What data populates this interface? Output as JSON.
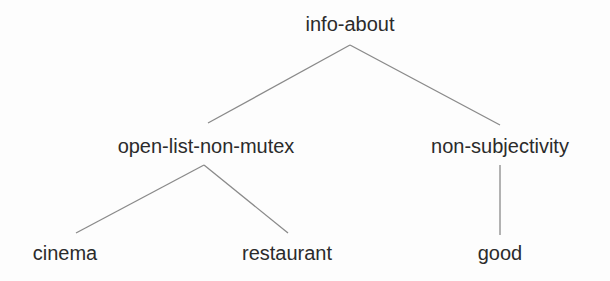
{
  "diagram": {
    "type": "tree",
    "colors": {
      "background": "#fdfdfd",
      "text": "#2b2b2b",
      "edge": "#8a8a8a"
    },
    "nodes": [
      {
        "id": "info-about",
        "label": "info-about",
        "x": 350,
        "y": 14
      },
      {
        "id": "open-list-non-mutex",
        "label": "open-list-non-mutex",
        "x": 206,
        "y": 136
      },
      {
        "id": "non-subjectivity",
        "label": "non-subjectivity",
        "x": 500,
        "y": 136
      },
      {
        "id": "cinema",
        "label": "cinema",
        "x": 65,
        "y": 243
      },
      {
        "id": "restaurant",
        "label": "restaurant",
        "x": 287,
        "y": 243
      },
      {
        "id": "good",
        "label": "good",
        "x": 500,
        "y": 243
      }
    ],
    "edges": [
      {
        "from": "info-about",
        "to": "open-list-non-mutex"
      },
      {
        "from": "info-about",
        "to": "non-subjectivity"
      },
      {
        "from": "open-list-non-mutex",
        "to": "cinema"
      },
      {
        "from": "open-list-non-mutex",
        "to": "restaurant"
      },
      {
        "from": "non-subjectivity",
        "to": "good"
      }
    ]
  }
}
